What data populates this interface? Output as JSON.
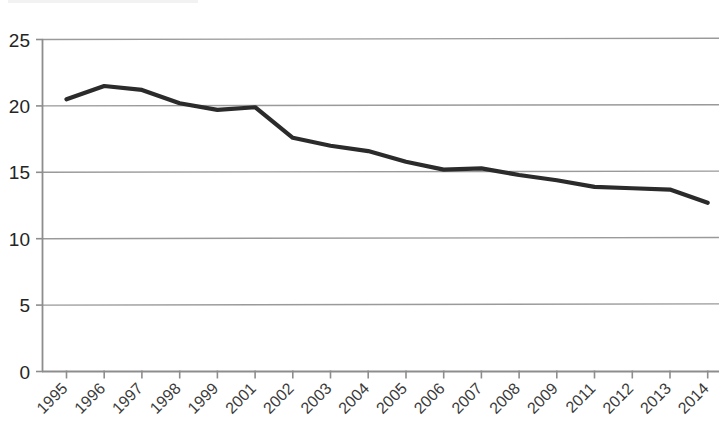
{
  "chart_data": {
    "type": "line",
    "title": "",
    "subtitle": "",
    "xlabel": "",
    "ylabel": "",
    "categories": [
      "1995",
      "1996",
      "1997",
      "1998",
      "1999",
      "2001",
      "2002",
      "2003",
      "2004",
      "2005",
      "2006",
      "2007",
      "2008",
      "2009",
      "2011",
      "2012",
      "2013",
      "2014"
    ],
    "values": [
      20.5,
      21.5,
      21.2,
      20.2,
      19.7,
      19.9,
      17.6,
      17.0,
      16.6,
      15.8,
      15.2,
      15.3,
      14.8,
      14.4,
      13.9,
      13.8,
      13.7,
      12.7
    ],
    "series": [
      {
        "name": "series-1",
        "color": "#2b2b2b",
        "values": [
          20.5,
          21.5,
          21.2,
          20.2,
          19.7,
          19.9,
          17.6,
          17.0,
          16.6,
          15.8,
          15.2,
          15.3,
          14.8,
          14.4,
          13.9,
          13.8,
          13.7,
          12.7
        ]
      }
    ],
    "ylim": [
      0,
      25
    ],
    "yticks": [
      0,
      5,
      10,
      15,
      20,
      25
    ],
    "ytick_labels": [
      "0",
      "5",
      "10",
      "15",
      "20",
      "25"
    ],
    "grid": true,
    "grid_axis": "y",
    "legend": false,
    "legend_position": "none",
    "xtick_rotation": 45,
    "annotations": []
  },
  "colors": {
    "series_line": "#2b2b2b",
    "gridline": "#9a9a9a",
    "axis": "#8d8d8d",
    "background": "#ffffff",
    "ytick_text": "#242424",
    "xtick_text": "#3a3a3a"
  }
}
